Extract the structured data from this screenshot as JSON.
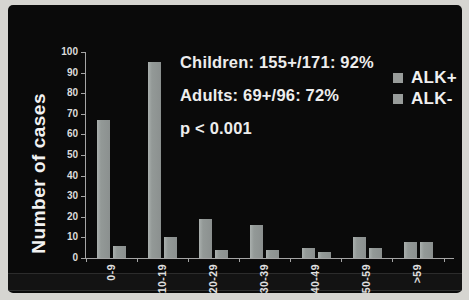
{
  "chart_data": {
    "type": "bar",
    "title": "",
    "ylabel": "Number of cases",
    "xlabel": "",
    "categories": [
      "0-9",
      "10-19",
      "20-29",
      "30-39",
      "40-49",
      "50-59",
      ">59"
    ],
    "series": [
      {
        "name": "ALK+",
        "values": [
          67,
          95,
          19,
          16,
          5,
          10,
          8
        ]
      },
      {
        "name": "ALK-",
        "values": [
          6,
          10,
          4,
          4,
          3,
          5,
          8
        ]
      }
    ],
    "ylim": [
      0,
      100
    ],
    "yticks": [
      0,
      10,
      20,
      30,
      40,
      50,
      60,
      70,
      80,
      90,
      100
    ],
    "grid": false,
    "legend_position": "top-right",
    "bar_color": "#939997",
    "annotations": [
      "Children: 155+/171: 92%",
      "Adults: 69+/96: 72%",
      "p < 0.001"
    ]
  },
  "colors": {
    "slide_background": "#0a0a0a",
    "page_border": "#d6d5d1",
    "bar": "#939997",
    "axis": "#a5a5a5",
    "text": "#ededed"
  }
}
